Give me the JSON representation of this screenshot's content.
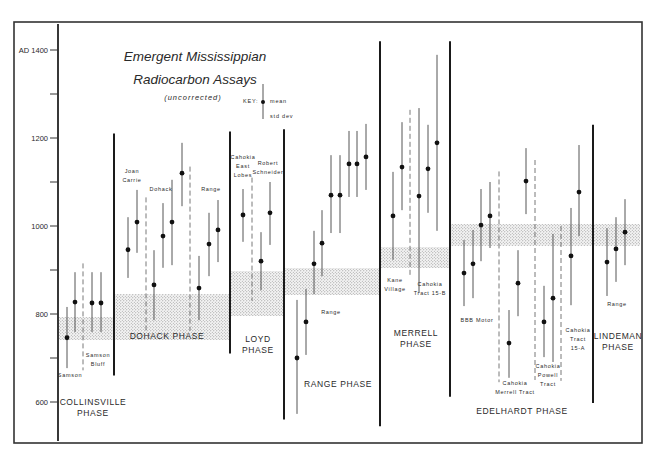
{
  "chart_data": {
    "type": "scatter",
    "title": "Emergent Mississippian",
    "subtitle": "Radiocarbon Assays",
    "note": "(uncorrected)",
    "xlabel": "",
    "ylabel": "AD",
    "ylim": [
      540,
      1460
    ],
    "y_ticks": [
      {
        "value": 1400,
        "label": "AD 1400"
      },
      {
        "value": 1300,
        "label": ""
      },
      {
        "value": 1200,
        "label": "1200"
      },
      {
        "value": 1100,
        "label": ""
      },
      {
        "value": 1000,
        "label": "1000"
      },
      {
        "value": 900,
        "label": ""
      },
      {
        "value": 800,
        "label": "800"
      },
      {
        "value": 700,
        "label": ""
      },
      {
        "value": 600,
        "label": "600"
      }
    ],
    "grid": false,
    "key": {
      "label": "KEY:",
      "mean_label": "mean",
      "sd_label": "std dev"
    },
    "phases": [
      {
        "name": "COLLINSVILLE PHASE",
        "name_lines": [
          "COLLINSVILLE",
          "PHASE"
        ],
        "band": [
          800,
          745
        ],
        "sites": [
          {
            "label": "Samson",
            "assays": [
              {
                "mean": 746,
                "low": 677,
                "high": 816
              }
            ]
          },
          {
            "label": "Samson Bluff",
            "assays": [
              {
                "mean": 827,
                "low": 759,
                "high": 895
              },
              {
                "mean": 825,
                "low": 759,
                "high": 895
              },
              {
                "mean": 825,
                "low": 759,
                "high": 895
              }
            ]
          }
        ]
      },
      {
        "name": "DOHACK PHASE",
        "name_lines": [
          "DOHACK PHASE"
        ],
        "band": [
          850,
          745
        ],
        "sites": [
          {
            "label": "Joan Carrie",
            "assays": [
              {
                "mean": 946,
                "low": 882,
                "high": 1020
              },
              {
                "mean": 1009,
                "low": 939,
                "high": 1082
              }
            ]
          },
          {
            "label": "Dohack",
            "assays": [
              {
                "mean": 866,
                "low": 786,
                "high": 945
              },
              {
                "mean": 977,
                "low": 905,
                "high": 1052
              },
              {
                "mean": 1009,
                "low": 911,
                "high": 1105
              },
              {
                "mean": 1120,
                "low": 1045,
                "high": 1189
              }
            ]
          },
          {
            "label": "Range",
            "assays": [
              {
                "mean": 859,
                "low": 786,
                "high": 932
              },
              {
                "mean": 959,
                "low": 886,
                "high": 1030
              },
              {
                "mean": 991,
                "low": 918,
                "high": 1059
              }
            ]
          }
        ]
      },
      {
        "name": "LOYD PHASE",
        "name_lines": [
          "LOYD",
          "PHASE"
        ],
        "band": [
          900,
          798
        ],
        "sites": [
          {
            "label": "Cahokia East Lobes",
            "assays": [
              {
                "mean": 1025,
                "low": 964,
                "high": 1084
              }
            ]
          },
          {
            "label": "Robert Schneider",
            "assays": [
              {
                "mean": 920,
                "low": 854,
                "high": 986
              },
              {
                "mean": 1030,
                "low": 957,
                "high": 1100
              }
            ]
          }
        ]
      },
      {
        "name": "RANGE PHASE",
        "name_lines": [
          "RANGE PHASE"
        ],
        "band": [
          905,
          845
        ],
        "sites": [
          {
            "label": "Range",
            "assays": [
              {
                "mean": 700,
                "low": 573,
                "high": 832
              },
              {
                "mean": 782,
                "low": 707,
                "high": 857
              },
              {
                "mean": 914,
                "low": 845,
                "high": 989
              },
              {
                "mean": 961,
                "low": 886,
                "high": 1036
              },
              {
                "mean": 1070,
                "low": 984,
                "high": 1161
              },
              {
                "mean": 1070,
                "low": 984,
                "high": 1161
              },
              {
                "mean": 1141,
                "low": 1066,
                "high": 1216
              },
              {
                "mean": 1141,
                "low": 1066,
                "high": 1216
              },
              {
                "mean": 1157,
                "low": 1082,
                "high": 1232
              }
            ]
          }
        ]
      },
      {
        "name": "MERRELL PHASE",
        "name_lines": [
          "MERRELL",
          "PHASE"
        ],
        "band": [
          955,
          907
        ],
        "sites": [
          {
            "label": "Kane Village",
            "assays": [
              {
                "mean": 1023,
                "low": 923,
                "high": 1123
              },
              {
                "mean": 1134,
                "low": 1036,
                "high": 1236
              }
            ]
          },
          {
            "label": "Cahokia Tract 15-B",
            "assays": [
              {
                "mean": 1068,
                "low": 848,
                "high": 1268
              },
              {
                "mean": 1130,
                "low": 1030,
                "high": 1230
              },
              {
                "mean": 1189,
                "low": 989,
                "high": 1389
              }
            ]
          }
        ]
      },
      {
        "name": "EDELHARDT PHASE",
        "name_lines": [
          "EDELHARDT PHASE"
        ],
        "band": [
          1005,
          955
        ],
        "sites": [
          {
            "label": "BBB Motor",
            "assays": [
              {
                "mean": 893,
                "low": 818,
                "high": 968
              },
              {
                "mean": 914,
                "low": 836,
                "high": 991
              },
              {
                "mean": 1002,
                "low": 920,
                "high": 1084
              },
              {
                "mean": 1023,
                "low": 950,
                "high": 1100
              }
            ]
          },
          {
            "label": "Cahokia Merrell Tract",
            "assays": [
              {
                "mean": 734,
                "low": 655,
                "high": 809
              },
              {
                "mean": 870,
                "low": 795,
                "high": 945
              },
              {
                "mean": 1102,
                "low": 1027,
                "high": 1177
              }
            ]
          },
          {
            "label": "Cahokia Powell Tract",
            "assays": [
              {
                "mean": 782,
                "low": 702,
                "high": 864
              },
              {
                "mean": 836,
                "low": 691,
                "high": 982
              }
            ]
          },
          {
            "label": "Cahokia Tract 15-A",
            "assays": [
              {
                "mean": 932,
                "low": 820,
                "high": 1041
              },
              {
                "mean": 1077,
                "low": 977,
                "high": 1184
              }
            ]
          }
        ]
      },
      {
        "name": "LINDEMAN PHASE",
        "name_lines": [
          "LINDEMAN",
          "PHASE"
        ],
        "band": [
          1005,
          955
        ],
        "sites": [
          {
            "label": "Range",
            "assays": [
              {
                "mean": 918,
                "low": 841,
                "high": 995
              },
              {
                "mean": 948,
                "low": 873,
                "high": 1020
              },
              {
                "mean": 986,
                "low": 911,
                "high": 1061
              }
            ]
          }
        ]
      }
    ]
  },
  "layout": {
    "axis_x": 58,
    "y_at_1400": 50,
    "px_per_year": 0.44,
    "phase_dividers": [
      {
        "x": 114,
        "top": 1210,
        "bottom": 660
      },
      {
        "x": 230,
        "top": 1215,
        "bottom": 710
      },
      {
        "x": 284,
        "top": 1220,
        "bottom": 560
      },
      {
        "x": 380,
        "top": 1420,
        "bottom": 545
      },
      {
        "x": 450,
        "top": 1420,
        "bottom": 612
      },
      {
        "x": 593,
        "top": 1230,
        "bottom": 598
      }
    ],
    "site_dividers": [
      {
        "x": 83,
        "top": 915,
        "bottom": 672
      },
      {
        "x": 146,
        "top": 1065,
        "bottom": 762
      },
      {
        "x": 190,
        "top": 1135,
        "bottom": 762
      },
      {
        "x": 252,
        "top": 1110,
        "bottom": 830
      },
      {
        "x": 410,
        "top": 1264,
        "bottom": 886
      },
      {
        "x": 499,
        "top": 1124,
        "bottom": 645
      },
      {
        "x": 535,
        "top": 1150,
        "bottom": 650
      },
      {
        "x": 561,
        "top": 1000,
        "bottom": 648
      }
    ],
    "assay_x": [
      [
        67
      ],
      [
        75,
        92,
        101
      ],
      [
        128,
        137
      ],
      [
        154,
        163,
        172,
        182
      ],
      [
        199,
        209,
        218
      ],
      [
        243
      ],
      [
        261,
        270
      ],
      [
        297,
        306,
        314,
        322,
        331,
        340,
        349,
        357,
        366
      ],
      [
        393,
        402
      ],
      [
        419,
        428,
        437
      ],
      [
        464,
        473,
        481,
        490
      ],
      [
        509,
        518,
        526
      ],
      [
        544,
        553
      ],
      [
        571,
        579
      ],
      [
        607,
        616,
        625
      ]
    ],
    "bands": [
      {
        "x1": 58,
        "x2": 114,
        "y1": 317,
        "y2": 340
      },
      {
        "x1": 114,
        "x2": 230,
        "y1": 294,
        "y2": 340
      },
      {
        "x1": 230,
        "x2": 284,
        "y1": 271,
        "y2": 316
      },
      {
        "x1": 284,
        "x2": 380,
        "y1": 268,
        "y2": 295
      },
      {
        "x1": 380,
        "x2": 450,
        "y1": 247,
        "y2": 268
      },
      {
        "x1": 450,
        "x2": 640,
        "y1": 224,
        "y2": 246
      }
    ],
    "site_labels": [
      {
        "lines": [
          "Samson"
        ],
        "x": 70,
        "y": 377
      },
      {
        "lines": [
          "Samson",
          "Bluff"
        ],
        "x": 98,
        "y": 357
      },
      {
        "lines": [
          "Joan",
          "Carrie"
        ],
        "x": 132,
        "y": 173
      },
      {
        "lines": [
          "Dohack"
        ],
        "x": 161,
        "y": 191
      },
      {
        "lines": [
          "Range"
        ],
        "x": 211,
        "y": 191
      },
      {
        "lines": [
          "Cahokia",
          "East",
          "Lobes"
        ],
        "x": 243,
        "y": 159
      },
      {
        "lines": [
          "Robert",
          "Schneider"
        ],
        "x": 268,
        "y": 165
      },
      {
        "lines": [
          "Range"
        ],
        "x": 331,
        "y": 314
      },
      {
        "lines": [
          "Kane",
          "Village"
        ],
        "x": 395,
        "y": 282
      },
      {
        "lines": [
          "Cahokia",
          "Tract 15-B"
        ],
        "x": 430,
        "y": 286
      },
      {
        "lines": [
          "BBB Motor"
        ],
        "x": 477,
        "y": 322
      },
      {
        "lines": [
          "Cahokia",
          "Merrell Tract"
        ],
        "x": 515,
        "y": 385
      },
      {
        "lines": [
          "Cahokia",
          "Powell",
          "Tract"
        ],
        "x": 548,
        "y": 368
      },
      {
        "lines": [
          "Cahokia",
          "Tract",
          "15-A"
        ],
        "x": 578,
        "y": 332
      },
      {
        "lines": [
          "Range"
        ],
        "x": 617,
        "y": 306
      }
    ],
    "phase_labels": [
      {
        "x": 93,
        "y": 405
      },
      {
        "x": 167,
        "y": 339
      },
      {
        "x": 258,
        "y": 342
      },
      {
        "x": 338,
        "y": 387
      },
      {
        "x": 416,
        "y": 336
      },
      {
        "x": 522,
        "y": 414
      },
      {
        "x": 618,
        "y": 339
      }
    ]
  }
}
